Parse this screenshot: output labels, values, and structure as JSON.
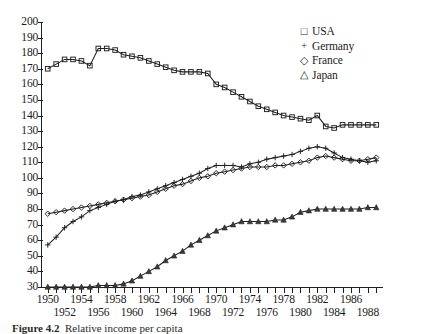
{
  "chart_data": {
    "type": "line",
    "title": "",
    "xlabel": "",
    "ylabel": "",
    "xlim": [
      1949.2,
      1989.8
    ],
    "ylim": [
      30,
      200
    ],
    "ytick_step": 10,
    "grid": false,
    "legend_position": "top-right",
    "ytick_labels": [
      "200",
      "190",
      "180",
      "170",
      "160",
      "150",
      "140",
      "130",
      "120",
      "110",
      "100",
      "90",
      "80",
      "70",
      "60",
      "50",
      "40",
      "30"
    ],
    "xtick_labels_upper": [
      "1950",
      "1954",
      "1958",
      "1962",
      "1966",
      "1970",
      "1974",
      "1978",
      "1982",
      "1986"
    ],
    "xtick_labels_lower": [
      "1952",
      "1956",
      "1960",
      "1964",
      "1968",
      "1972",
      "1976",
      "1980",
      "1984",
      "1988"
    ],
    "x": [
      1950,
      1951,
      1952,
      1953,
      1954,
      1955,
      1956,
      1957,
      1958,
      1959,
      1960,
      1961,
      1962,
      1963,
      1964,
      1965,
      1966,
      1967,
      1968,
      1969,
      1970,
      1971,
      1972,
      1973,
      1974,
      1975,
      1976,
      1977,
      1978,
      1979,
      1980,
      1981,
      1982,
      1983,
      1984,
      1985,
      1986,
      1987,
      1988,
      1989
    ],
    "series": [
      {
        "name": "USA",
        "marker": "square",
        "values": [
          170,
          173,
          176,
          176,
          175,
          172,
          183,
          183,
          182,
          179,
          178,
          177,
          175,
          173,
          171,
          169,
          168,
          168,
          168,
          167,
          160,
          158,
          155,
          152,
          149,
          146,
          144,
          142,
          140,
          139,
          138,
          137,
          140,
          133,
          132,
          134,
          134,
          134,
          134,
          134
        ]
      },
      {
        "name": "Germany",
        "marker": "plus",
        "values": [
          57,
          62,
          68,
          72,
          75,
          79,
          81,
          83,
          85,
          86,
          88,
          89,
          91,
          93,
          95,
          97,
          99,
          101,
          103,
          106,
          108,
          108,
          108,
          107,
          109,
          110,
          112,
          113,
          114,
          115,
          117,
          119,
          120,
          119,
          116,
          113,
          112,
          111,
          110,
          111
        ]
      },
      {
        "name": "France",
        "marker": "diamond",
        "values": [
          77,
          78,
          79,
          80,
          81,
          82,
          83,
          84,
          85,
          86,
          87,
          88,
          89,
          91,
          93,
          95,
          96,
          98,
          100,
          101,
          103,
          104,
          105,
          106,
          107,
          107,
          107,
          108,
          108,
          109,
          110,
          111,
          113,
          114,
          113,
          112,
          111,
          111,
          112,
          113
        ]
      },
      {
        "name": "Japan",
        "marker": "triangle",
        "values": [
          29,
          29,
          29,
          29,
          30,
          30,
          31,
          31,
          31,
          32,
          34,
          37,
          40,
          43,
          47,
          50,
          53,
          57,
          60,
          63,
          66,
          68,
          70,
          72,
          72,
          72,
          72,
          73,
          73,
          75,
          78,
          79,
          80,
          80,
          80,
          80,
          80,
          80,
          81,
          81
        ]
      }
    ]
  },
  "legend": {
    "items": [
      {
        "label": "USA",
        "marker": "square"
      },
      {
        "label": "Germany",
        "marker": "plus"
      },
      {
        "label": "France",
        "marker": "diamond"
      },
      {
        "label": "Japan",
        "marker": "triangle"
      }
    ]
  },
  "caption": {
    "label": "Figure 4.2",
    "text": "Relative income per capita"
  }
}
